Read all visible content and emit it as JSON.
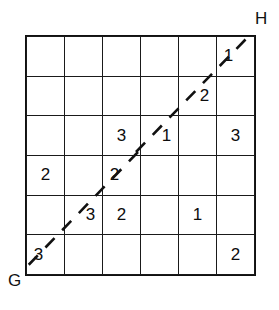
{
  "figure": {
    "type": "grid-diagram",
    "width": 279,
    "height": 310,
    "background_color": "#ffffff",
    "line_color": "#1a1a1a",
    "text_color": "#0d0d0d"
  },
  "labels": {
    "top_right": "H",
    "bottom_left": "G"
  },
  "grid": {
    "rows": 6,
    "columns": 6,
    "cells": [
      [
        {
          "value": "",
          "nudge": ""
        },
        {
          "value": "",
          "nudge": ""
        },
        {
          "value": "",
          "nudge": ""
        },
        {
          "value": "",
          "nudge": ""
        },
        {
          "value": "",
          "nudge": ""
        },
        {
          "value": "1",
          "nudge": "left"
        }
      ],
      [
        {
          "value": "",
          "nudge": ""
        },
        {
          "value": "",
          "nudge": ""
        },
        {
          "value": "",
          "nudge": ""
        },
        {
          "value": "",
          "nudge": ""
        },
        {
          "value": "2",
          "nudge": "right"
        },
        {
          "value": "",
          "nudge": ""
        }
      ],
      [
        {
          "value": "",
          "nudge": ""
        },
        {
          "value": "",
          "nudge": ""
        },
        {
          "value": "3",
          "nudge": ""
        },
        {
          "value": "1",
          "nudge": "right"
        },
        {
          "value": "",
          "nudge": ""
        },
        {
          "value": "3",
          "nudge": ""
        }
      ],
      [
        {
          "value": "2",
          "nudge": ""
        },
        {
          "value": "",
          "nudge": ""
        },
        {
          "value": "2",
          "nudge": "left"
        },
        {
          "value": "",
          "nudge": ""
        },
        {
          "value": "",
          "nudge": ""
        },
        {
          "value": "",
          "nudge": ""
        }
      ],
      [
        {
          "value": "",
          "nudge": ""
        },
        {
          "value": "3",
          "nudge": "right"
        },
        {
          "value": "2",
          "nudge": ""
        },
        {
          "value": "",
          "nudge": ""
        },
        {
          "value": "1",
          "nudge": ""
        },
        {
          "value": "",
          "nudge": ""
        }
      ],
      [
        {
          "value": "3",
          "nudge": "left"
        },
        {
          "value": "",
          "nudge": ""
        },
        {
          "value": "",
          "nudge": ""
        },
        {
          "value": "",
          "nudge": ""
        },
        {
          "value": "",
          "nudge": ""
        },
        {
          "value": "2",
          "nudge": ""
        }
      ]
    ]
  },
  "diagonal": {
    "style": "dashed",
    "arrowheads": "both",
    "from": "bottom-left-corner",
    "to": "top-right-corner",
    "color": "#111111"
  }
}
